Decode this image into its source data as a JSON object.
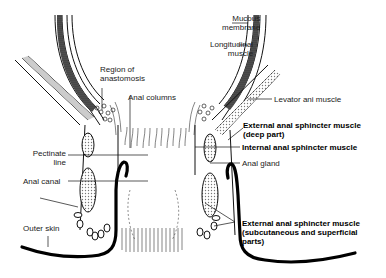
{
  "diagram": {
    "type": "anatomical cross-section",
    "subject": "anal canal",
    "labels": [
      {
        "id": "mucous-membrane",
        "text_lines": [
          "Mucous",
          "membrane"
        ],
        "bold": false
      },
      {
        "id": "longitudinal-muscle",
        "text_lines": [
          "Longitudinal",
          "muscle"
        ],
        "bold": false
      },
      {
        "id": "region-of-anastomosis",
        "text_lines": [
          "Region of",
          "anastomosis"
        ],
        "bold": false
      },
      {
        "id": "anal-columns",
        "text_lines": [
          "Anal columns"
        ],
        "bold": false
      },
      {
        "id": "levator-ani-muscle",
        "text_lines": [
          "Levator ani muscle"
        ],
        "bold": false
      },
      {
        "id": "external-sphincter-deep",
        "text_lines": [
          "External anal sphincter muscle",
          "(deep part)"
        ],
        "bold": true
      },
      {
        "id": "internal-sphincter",
        "text_lines": [
          "Internal anal sphincter muscle"
        ],
        "bold": true
      },
      {
        "id": "anal-gland",
        "text_lines": [
          "Anal gland"
        ],
        "bold": false
      },
      {
        "id": "pectinate-line",
        "text_lines": [
          "Pectinate",
          "line"
        ],
        "bold": false
      },
      {
        "id": "anal-canal",
        "text_lines": [
          "Anal canal"
        ],
        "bold": false
      },
      {
        "id": "outer-skin",
        "text_lines": [
          "Outer skin"
        ],
        "bold": false
      },
      {
        "id": "external-sphincter-superficial",
        "text_lines": [
          "External anal sphincter muscle",
          "(subcutaneous and superficial",
          "parts)"
        ],
        "bold": true
      }
    ],
    "colors": {
      "line": "#111111",
      "stipple": "#bbbbbb",
      "background": "#ffffff"
    }
  }
}
